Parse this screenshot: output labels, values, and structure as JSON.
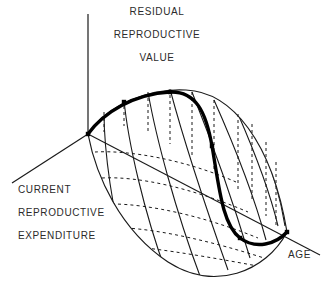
{
  "figure": {
    "kind": "3d-surface-diagram",
    "title_visible": false,
    "background_color": "#ffffff",
    "line_color": "#1a1a1a",
    "bold_curve_color": "#000000",
    "text_color": "#2b2b2b"
  },
  "axes": {
    "vertical": {
      "name": "residual-reproductive-value",
      "label_lines": [
        "RESIDUAL",
        "REPRODUCTIVE",
        "VALUE"
      ],
      "direction": "up"
    },
    "left": {
      "name": "current-reproductive-expenditure",
      "label_lines": [
        "CURRENT",
        "REPRODUCTIVE",
        "EXPENDITURE"
      ],
      "direction": "down-left"
    },
    "right": {
      "name": "age",
      "label_lines": [
        "AGE"
      ],
      "direction": "down-right"
    }
  },
  "chart_data": {
    "type": "line",
    "title": "",
    "xlabel": "AGE",
    "ylabel": "RESIDUAL REPRODUCTIVE VALUE",
    "zlabel": "CURRENT REPRODUCTIVE EXPENDITURE",
    "legend": [],
    "grid": false,
    "surface": {
      "outline_upper": "M 88 134 C 108 104, 150 88, 186 90 C 232 92, 272 142, 287 232",
      "outline_lower": "M 88 134 C 96 176, 120 230, 168 262 C 214 292, 266 272, 287 232",
      "mesh_solid": [
        "M 104 112 C 104 150, 112 212, 128 268",
        "M 124 100 C 128 142, 144 212, 166 272",
        "M 148 92 C 156 138, 176 212, 200 276",
        "M 170 89 C 182 134, 206 208, 228 270",
        "M 192 92 C 208 132, 232 198, 250 258",
        "M 214 100 C 230 136, 252 188, 266 240",
        "M 238 114 C 252 146, 268 184, 278 226",
        "M 260 140 C 270 164, 280 194, 285 226"
      ],
      "mesh_contour_dashed": [
        "M 95 152 C 130 150, 186 160, 236 182",
        "M 102 178 C 138 176, 192 188, 248 212",
        "M 112 204 C 148 204, 204 216, 258 238",
        "M 126 228 C 162 230, 214 242, 264 258",
        "M 146 248 C 180 252, 226 260, 268 268"
      ],
      "drop_lines_dashed": [
        "M 104 112 L 104 132",
        "M 124 100 L 124 126",
        "M 148 92 L 148 132",
        "M 170 89 L 170 144",
        "M 192 92 L 192 156",
        "M 214 100 L 214 172",
        "M 238 114 L 238 190",
        "M 252 124 L 252 202",
        "M 266 142 L 266 216",
        "M 276 162 L 276 226"
      ],
      "base_axis_line": "M 88 134 L 320 255"
    },
    "optimal_curve": {
      "name": "optimal-trajectory",
      "path": "M 88 134 C 104 112, 134 94, 170 92 C 196 91, 206 112, 212 146 C 219 186, 222 224, 240 238 C 256 250, 276 244, 287 232",
      "width_px": 3.4,
      "markers": [
        {
          "x": 88,
          "y": 134
        },
        {
          "x": 124,
          "y": 102
        },
        {
          "x": 170,
          "y": 92
        },
        {
          "x": 212,
          "y": 146
        },
        {
          "x": 240,
          "y": 238
        },
        {
          "x": 287,
          "y": 232
        }
      ]
    },
    "axis_lines": {
      "vertical": {
        "x1": 88,
        "y1": 14,
        "x2": 88,
        "y2": 134
      },
      "left": {
        "x1": 88,
        "y1": 134,
        "x2": 12,
        "y2": 183
      },
      "right": {
        "x1": 88,
        "y1": 134,
        "x2": 320,
        "y2": 255
      }
    }
  }
}
